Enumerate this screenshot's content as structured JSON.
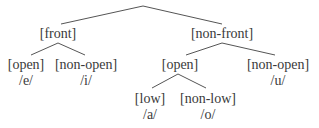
{
  "diagram": {
    "type": "feature-tree",
    "line_color": "#555555",
    "text_color": "#3a3a3a",
    "root": {
      "x": 143,
      "y": 6
    },
    "nodes": [
      {
        "id": "front",
        "label": "[front]",
        "x": 58,
        "y": 26
      },
      {
        "id": "non-front",
        "label": "[non-front]",
        "x": 222,
        "y": 26
      },
      {
        "id": "front-open",
        "label": "[open]",
        "x": 26,
        "y": 57
      },
      {
        "id": "e",
        "label": "/e/",
        "x": 26,
        "y": 73
      },
      {
        "id": "front-non-open",
        "label": "[non-open]",
        "x": 86,
        "y": 57
      },
      {
        "id": "i",
        "label": "/i/",
        "x": 86,
        "y": 73
      },
      {
        "id": "nonfront-open",
        "label": "[open]",
        "x": 180,
        "y": 57
      },
      {
        "id": "nonfront-non-open",
        "label": "[non-open]",
        "x": 278,
        "y": 57
      },
      {
        "id": "u",
        "label": "/u/",
        "x": 278,
        "y": 73
      },
      {
        "id": "low",
        "label": "[low]",
        "x": 150,
        "y": 91
      },
      {
        "id": "a",
        "label": "/a/",
        "x": 150,
        "y": 107
      },
      {
        "id": "non-low",
        "label": "[non-low]",
        "x": 208,
        "y": 91
      },
      {
        "id": "o",
        "label": "/o/",
        "x": 208,
        "y": 107
      }
    ],
    "edges": [
      {
        "from": "root",
        "x1": 143,
        "y1": 6,
        "x2": 61,
        "y2": 24
      },
      {
        "from": "root",
        "x1": 143,
        "y1": 6,
        "x2": 222,
        "y2": 24
      },
      {
        "from": "front",
        "x1": 58,
        "y1": 43,
        "x2": 31,
        "y2": 55
      },
      {
        "from": "front",
        "x1": 58,
        "y1": 43,
        "x2": 85,
        "y2": 55
      },
      {
        "from": "non-front",
        "x1": 222,
        "y1": 43,
        "x2": 186,
        "y2": 55
      },
      {
        "from": "non-front",
        "x1": 222,
        "y1": 43,
        "x2": 275,
        "y2": 55
      },
      {
        "from": "nonfront-open",
        "x1": 178,
        "y1": 74,
        "x2": 152,
        "y2": 88
      },
      {
        "from": "nonfront-open",
        "x1": 178,
        "y1": 74,
        "x2": 206,
        "y2": 88
      }
    ]
  }
}
